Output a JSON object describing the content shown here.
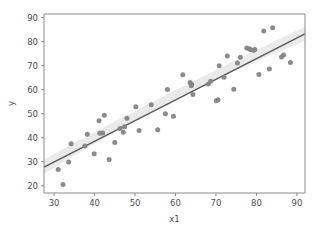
{
  "chart_data": {
    "type": "scatter",
    "title": "",
    "xlabel": "x1",
    "ylabel": "y",
    "xlim": [
      27.5,
      92.0
    ],
    "ylim": [
      17.0,
      91.5
    ],
    "xticks": [
      30,
      40,
      50,
      60,
      70,
      80,
      90
    ],
    "yticks": [
      20,
      30,
      40,
      50,
      60,
      70,
      80,
      90
    ],
    "grid": false,
    "legend": null,
    "point_color": "#858585",
    "line_color": "#5a5a5a",
    "band_color": "#b8b8b8",
    "background_color": "#ffffff",
    "series": [
      {
        "name": "observations",
        "marker": "circle",
        "points": [
          [
            31.0,
            26.8
          ],
          [
            32.2,
            20.5
          ],
          [
            33.6,
            29.9
          ],
          [
            34.2,
            37.5
          ],
          [
            37.6,
            36.6
          ],
          [
            38.2,
            41.4
          ],
          [
            39.9,
            33.3
          ],
          [
            41.1,
            47.1
          ],
          [
            41.3,
            41.9
          ],
          [
            42.0,
            42.0
          ],
          [
            42.4,
            49.4
          ],
          [
            43.6,
            30.9
          ],
          [
            45.0,
            38.0
          ],
          [
            46.3,
            43.8
          ],
          [
            47.1,
            42.3
          ],
          [
            47.4,
            44.6
          ],
          [
            48.0,
            48.1
          ],
          [
            50.2,
            52.9
          ],
          [
            51.0,
            43.0
          ],
          [
            54.0,
            53.7
          ],
          [
            55.6,
            43.3
          ],
          [
            57.5,
            50.0
          ],
          [
            58.0,
            60.1
          ],
          [
            59.5,
            48.9
          ],
          [
            61.8,
            66.2
          ],
          [
            63.6,
            63.0
          ],
          [
            63.9,
            61.6
          ],
          [
            64.0,
            62.2
          ],
          [
            64.3,
            58.0
          ],
          [
            68.1,
            62.4
          ],
          [
            68.7,
            63.5
          ],
          [
            70.1,
            55.4
          ],
          [
            70.5,
            55.8
          ],
          [
            70.8,
            70.0
          ],
          [
            72.0,
            65.2
          ],
          [
            72.8,
            74.0
          ],
          [
            74.4,
            60.2
          ],
          [
            75.3,
            71.1
          ],
          [
            76.0,
            73.5
          ],
          [
            77.6,
            77.3
          ],
          [
            78.2,
            77.0
          ],
          [
            78.6,
            76.6
          ],
          [
            79.3,
            76.4
          ],
          [
            79.6,
            76.7
          ],
          [
            80.6,
            66.3
          ],
          [
            81.8,
            84.4
          ],
          [
            83.2,
            68.6
          ],
          [
            84.0,
            85.8
          ],
          [
            86.2,
            73.6
          ],
          [
            86.7,
            74.4
          ],
          [
            88.4,
            71.3
          ]
        ]
      }
    ],
    "fit": {
      "name": "linear regression",
      "x_start": 27.5,
      "y_start": 27.8,
      "x_end": 92.0,
      "y_end": 83.2,
      "ci_upper_start": 31.0,
      "ci_lower_start": 25.0,
      "ci_upper_end": 86.2,
      "ci_lower_end": 80.4,
      "ci_upper_mid": 60.6,
      "ci_lower_mid": 58.6
    }
  }
}
